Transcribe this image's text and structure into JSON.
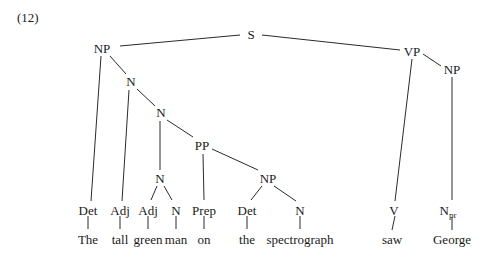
{
  "example_number": "(12)",
  "tree": {
    "nodes": {
      "S": {
        "label": "S",
        "x": 251,
        "y": 35
      },
      "NP_subj": {
        "label": "NP",
        "x": 102,
        "y": 49
      },
      "N1": {
        "label": "N",
        "x": 131,
        "y": 82
      },
      "N2": {
        "label": "N",
        "x": 161,
        "y": 113
      },
      "PP": {
        "label": "PP",
        "x": 202,
        "y": 146
      },
      "N3": {
        "label": "N",
        "x": 160,
        "y": 179
      },
      "NP_pp": {
        "label": "NP",
        "x": 268,
        "y": 179
      },
      "VP": {
        "label": "VP",
        "x": 412,
        "y": 52
      },
      "NP_obj": {
        "label": "NP",
        "x": 452,
        "y": 70
      },
      "Det1": {
        "label": "Det",
        "x": 88,
        "y": 211
      },
      "Adj1": {
        "label": "Adj",
        "x": 120,
        "y": 211
      },
      "Adj2": {
        "label": "Adj",
        "x": 148,
        "y": 211
      },
      "N_man": {
        "label": "N",
        "x": 176,
        "y": 211
      },
      "Prep": {
        "label": "Prep",
        "x": 204,
        "y": 211
      },
      "Det2": {
        "label": "Det",
        "x": 247,
        "y": 211
      },
      "N_spec": {
        "label": "N",
        "x": 300,
        "y": 211
      },
      "V": {
        "label": "V",
        "x": 393,
        "y": 211
      },
      "Npr": {
        "label": "N",
        "sub": "pr",
        "x": 452,
        "y": 211
      }
    },
    "words": [
      {
        "text": "The",
        "x": 88
      },
      {
        "text": "tall",
        "x": 120
      },
      {
        "text": "green",
        "x": 148
      },
      {
        "text": "man",
        "x": 176
      },
      {
        "text": "on",
        "x": 204
      },
      {
        "text": "the",
        "x": 247
      },
      {
        "text": "spectrograph",
        "x": 300
      },
      {
        "text": "saw",
        "x": 393
      },
      {
        "text": "George",
        "x": 452
      }
    ],
    "word_y": 243
  }
}
